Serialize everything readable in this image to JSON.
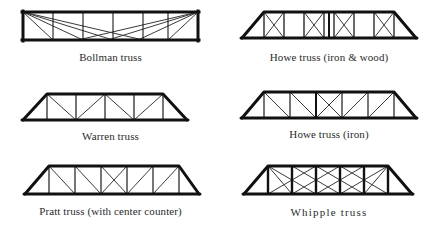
{
  "figure": {
    "background_color": "#ffffff",
    "line_color": "#111111",
    "web_color": "#3a3a3a",
    "caption_color": "#2b2b2b"
  },
  "trusses": [
    {
      "id": "bollman",
      "caption": "Bollman truss",
      "shape": "rectangular",
      "panels": 6,
      "web_pattern": "radiating diagonals from both top corners to each bottom panel point",
      "position": "top-left"
    },
    {
      "id": "howe-iron-wood",
      "caption": "Howe truss (iron & wood)",
      "shape": "trapezoidal with sloped end posts",
      "panels": 8,
      "web_pattern": "verticals with X cross-bracing in each interior panel",
      "position": "top-right"
    },
    {
      "id": "warren",
      "caption": "Warren truss",
      "shape": "trapezoidal with sloped end posts",
      "panels": 6,
      "web_pattern": "zigzag diagonals with verticals",
      "position": "middle-left"
    },
    {
      "id": "howe-iron",
      "caption": "Howe truss (iron)",
      "shape": "trapezoidal with sloped end posts",
      "panels": 6,
      "web_pattern": "verticals with diagonals sloping toward centre, X at centre panel",
      "position": "middle-right"
    },
    {
      "id": "pratt-center-counter",
      "caption": "Pratt truss (with center counter)",
      "shape": "trapezoidal with sloped end posts",
      "panels": 6,
      "web_pattern": "verticals with diagonals sloping toward centre, counter X at centre panel",
      "position": "bottom-left"
    },
    {
      "id": "whipple",
      "caption": "Whipple  truss",
      "shape": "trapezoidal with sloped end posts",
      "panels": 6,
      "web_pattern": "double-intersection diagonals crossing two panels, heavy verticals",
      "position": "bottom-right"
    }
  ]
}
